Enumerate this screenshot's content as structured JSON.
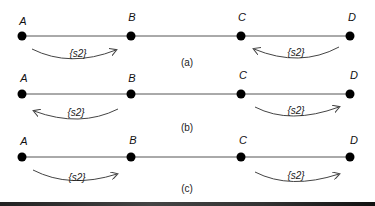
{
  "diagram": {
    "line_color": "#555555",
    "node_color": "#000000",
    "rows": [
      {
        "caption": "(a)",
        "nodes": [
          "A",
          "B",
          "C",
          "D"
        ],
        "arrows": [
          {
            "label": "{s2}",
            "from": "A",
            "to": "B",
            "direction": "right"
          },
          {
            "label": "{s2}",
            "from": "D",
            "to": "C",
            "direction": "left"
          }
        ]
      },
      {
        "caption": "(b)",
        "nodes": [
          "A",
          "B",
          "C",
          "D"
        ],
        "arrows": [
          {
            "label": "{s2}",
            "from": "B",
            "to": "A",
            "direction": "left"
          },
          {
            "label": "{s2}",
            "from": "C",
            "to": "D",
            "direction": "right"
          }
        ]
      },
      {
        "caption": "(c)",
        "nodes": [
          "A",
          "B",
          "C",
          "D"
        ],
        "arrows": [
          {
            "label": "{s2}",
            "from": "A",
            "to": "B",
            "direction": "right"
          },
          {
            "label": "{s2}",
            "from": "C",
            "to": "D",
            "direction": "right"
          }
        ]
      }
    ]
  }
}
